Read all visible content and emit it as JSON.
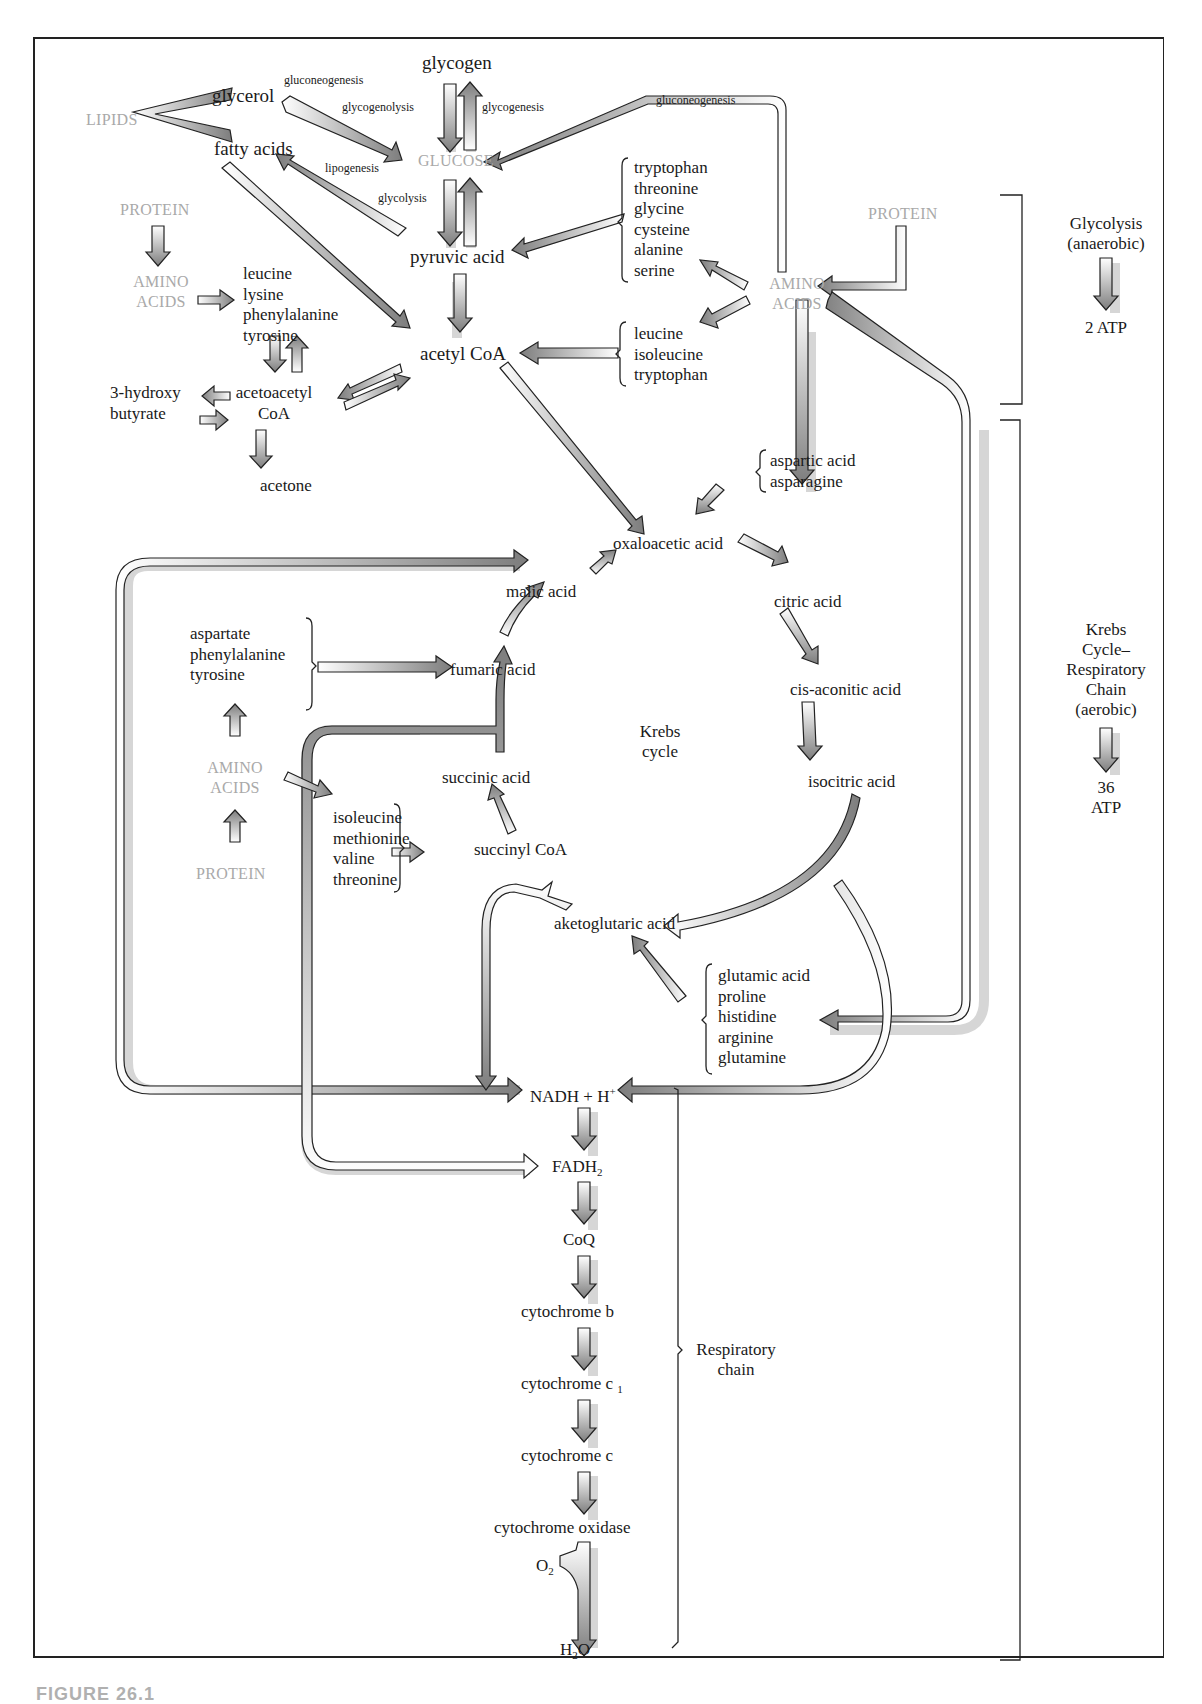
{
  "figure": {
    "caption": "FIGURE 26.1"
  },
  "sources": {
    "lipids": "LIPIDS",
    "glucose": "GLUCOSE",
    "protein_top_left": "PROTEIN",
    "amino_acids_top_left": [
      "AMINO",
      "ACIDS"
    ],
    "protein_top_right": "PROTEIN",
    "amino_acids_top_right": [
      "AMINO",
      "ACIDS"
    ],
    "amino_acids_mid_left": [
      "AMINO",
      "ACIDS"
    ],
    "protein_mid_left": "PROTEIN"
  },
  "carbohydrate": {
    "glycogen": "glycogen",
    "glycerol": "glycerol",
    "fatty_acids": "fatty acids",
    "pyruvic_acid": "pyruvic acid",
    "acetyl_coa": "acetyl CoA"
  },
  "process_labels": {
    "gluconeogenesis_glycerol": "gluconeogenesis",
    "glycogenolysis": "glycogenolysis",
    "glycogenesis": "glycogenesis",
    "lipogenesis": "lipogenesis",
    "glycolysis": "glycolysis",
    "gluconeogenesis_amino": "gluconeogenesis"
  },
  "ketone_bodies": {
    "group_amino": [
      "leucine",
      "lysine",
      "phenylalanine",
      "tyrosine"
    ],
    "acetoacetyl_coa": [
      "acetoacetyl",
      "CoA"
    ],
    "hydroxybutyrate": [
      "3-hydroxy",
      "butyrate"
    ],
    "acetone": "acetone"
  },
  "amino_groups": {
    "to_pyruvate": [
      "tryptophan",
      "threonine",
      "glycine",
      "cysteine",
      "alanine",
      "serine"
    ],
    "to_acetyl_coa": [
      "leucine",
      "isoleucine",
      "tryptophan"
    ],
    "to_oxaloacetate": [
      "aspartic acid",
      "asparagine"
    ],
    "to_fumarate": [
      "aspartate",
      "phenylalanine",
      "tyrosine"
    ],
    "to_succinyl_coa": [
      "isoleucine",
      "methionine",
      "valine",
      "threonine"
    ],
    "to_ketoglutarate": [
      "glutamic acid",
      "proline",
      "histidine",
      "arginine",
      "glutamine"
    ]
  },
  "krebs_cycle": {
    "center_label": [
      "Krebs",
      "cycle"
    ],
    "oxaloacetic_acid": "oxaloacetic acid",
    "citric_acid": "citric acid",
    "cis_aconitic_acid": "cis-aconitic acid",
    "isocitric_acid": "isocitric acid",
    "ketoglutaric_acid": "aketoglutaric acid",
    "succinyl_coa": "succinyl CoA",
    "succinic_acid": "succinic acid",
    "fumaric_acid": "fumaric acid",
    "malic_acid": "malic acid"
  },
  "respiratory_chain": {
    "nadh": "NADH + H",
    "nadh_sup": "+",
    "fadh": "FADH",
    "fadh_sub": "2",
    "coq": "CoQ",
    "cyt_b": "cytochrome b",
    "cyt_c1": "cytochrome c",
    "cyt_c1_sub": "1",
    "cyt_c": "cytochrome c",
    "cyt_oxidase": "cytochrome oxidase",
    "o2": "O",
    "o2_sub": "2",
    "h2o_h": "H",
    "h2o_sub": "2",
    "h2o_o": "O",
    "bracket_label": [
      "Respiratory",
      "chain"
    ]
  },
  "summary": {
    "glycolysis": [
      "Glycolysis",
      "(anaerobic)"
    ],
    "glycolysis_yield": "2 ATP",
    "aerobic": [
      "Krebs",
      "Cycle–",
      "Respiratory",
      "Chain",
      "(aerobic)"
    ],
    "aerobic_yield": [
      "36",
      "ATP"
    ]
  },
  "colors": {
    "ink": "#1a1a1a",
    "source_gray": "#a9a9a9",
    "arrow_dark": "#7d7d7d",
    "arrow_light": "#ffffff",
    "shadow": "#d4d4d4",
    "frame": "#222222"
  }
}
